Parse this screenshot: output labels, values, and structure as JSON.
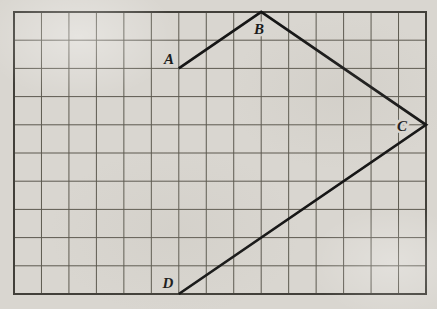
{
  "figure": {
    "type": "geometry-grid-diagram",
    "paper_color": "#d9d6d0",
    "grid": {
      "cols": 15,
      "rows": 10,
      "left": 14,
      "top": 12,
      "right": 426,
      "bottom": 294,
      "line_color": "#5c594f",
      "line_width": 1,
      "border_color": "#42403a",
      "border_width": 2
    },
    "stroke": {
      "color": "#161616",
      "width": 2.7
    },
    "points": [
      {
        "label": "A",
        "col": 6,
        "row": 2,
        "label_x": 169,
        "label_y": 64
      },
      {
        "label": "B",
        "col": 9,
        "row": 0,
        "label_x": 259,
        "label_y": 34
      },
      {
        "label": "C",
        "col": 15,
        "row": 4,
        "label_x": 402,
        "label_y": 131
      },
      {
        "label": "D",
        "col": 6,
        "row": 10,
        "label_x": 168,
        "label_y": 288
      }
    ],
    "segments": [
      [
        0,
        1
      ],
      [
        1,
        2
      ],
      [
        2,
        3
      ]
    ],
    "label_style": {
      "font_size": 15,
      "color": "#1b1b1b",
      "halo_width": 5
    }
  }
}
